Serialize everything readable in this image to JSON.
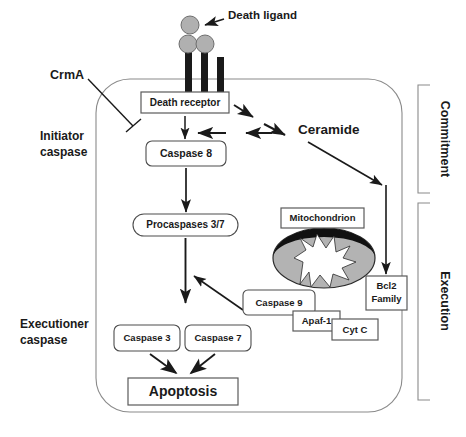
{
  "figure": {
    "type": "biological-pathway-diagram"
  },
  "colors": {
    "ligand_fill": "#b0b0b0",
    "ligand_stroke": "#6e6e6e",
    "stalk": "#1a1a1a",
    "membrane": "#8a8a8a",
    "box_stroke": "#4d4d4d",
    "arrow": "#1a1a1a",
    "mito_body": "#b3b3b3",
    "mito_cap": "#111111",
    "mito_cristae": "#ffffff",
    "text": "#1a1a1a"
  },
  "external_labels": {
    "death_ligand": "Death ligand",
    "crma": "CrmA",
    "initiator_caspase_line1": "Initiator",
    "initiator_caspase_line2": "caspase",
    "executioner_caspase_line1": "Executioner",
    "executioner_caspase_line2": "caspase",
    "ceramide": "Ceramide"
  },
  "nodes": {
    "death_receptor": "Death receptor",
    "caspase_8": "Caspase 8",
    "procaspases_37": "Procaspases 3/7",
    "caspase_3": "Caspase 3",
    "caspase_7": "Caspase 7",
    "apoptosis": "Apoptosis",
    "mitochondrion": "Mitochondrion",
    "bcl2_family_line1": "Bcl2",
    "bcl2_family_line2": "Family",
    "caspase_9": "Caspase 9",
    "apaf_1": "Apaf-1",
    "cyt_c": "Cyt C"
  },
  "brackets": {
    "commitment": "Commitment",
    "execution": "Execution"
  },
  "receptor_stalks": [
    {
      "id": "stalk-1",
      "has_ligand": true
    },
    {
      "id": "stalk-2",
      "has_ligand": true
    },
    {
      "id": "stalk-3",
      "has_ligand": false
    }
  ],
  "free_ligands": [
    {
      "id": "unbound-ligand-1"
    }
  ],
  "edges": [
    {
      "id": "ligand-pointer",
      "from": "death-ligand-label",
      "to": "unbound-ligand",
      "kind": "pointer"
    },
    {
      "id": "crma-inhibits-caspase8",
      "from": "CrmA",
      "to": "Initiator caspase pathway",
      "kind": "inhibition"
    },
    {
      "id": "receptor-to-caspase8",
      "from": "Death receptor",
      "to": "Caspase 8",
      "kind": "activation"
    },
    {
      "id": "receptor-to-ceramide-1",
      "from": "Death receptor",
      "to": "Ceramide",
      "kind": "activation"
    },
    {
      "id": "receptor-to-ceramide-2",
      "from": "Death receptor",
      "to": "Ceramide",
      "kind": "activation"
    },
    {
      "id": "ceramide-back-1",
      "from": "Ceramide",
      "to": "Caspase 8",
      "kind": "activation"
    },
    {
      "id": "ceramide-back-2",
      "from": "Ceramide",
      "to": "Caspase 8",
      "kind": "activation"
    },
    {
      "id": "ceramide-to-bcl2",
      "from": "Ceramide",
      "to": "Bcl2 Family",
      "kind": "activation"
    },
    {
      "id": "caspase8-to-procaspases",
      "from": "Caspase 8",
      "to": "Procaspases 3/7",
      "kind": "activation"
    },
    {
      "id": "procaspases-to-caspases37",
      "from": "Procaspases 3/7",
      "to": "Caspase 3 / Caspase 7",
      "kind": "activation"
    },
    {
      "id": "caspase9-to-procaspases",
      "from": "Caspase 9",
      "to": "Procaspases 3/7",
      "kind": "activation"
    },
    {
      "id": "bcl2-down",
      "from": "Ceramide",
      "to": "Bcl2 Family",
      "kind": "activation"
    },
    {
      "id": "caspase3-to-apoptosis",
      "from": "Caspase 3",
      "to": "Apoptosis",
      "kind": "activation"
    },
    {
      "id": "caspase7-to-apoptosis",
      "from": "Caspase 7",
      "to": "Apoptosis",
      "kind": "activation"
    }
  ]
}
